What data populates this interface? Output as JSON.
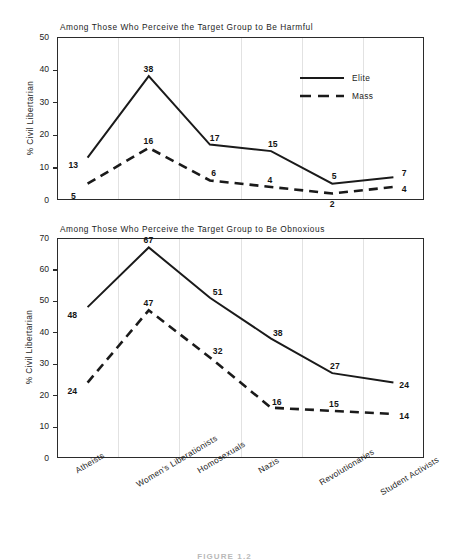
{
  "figure": {
    "caption": "FIGURE 1.2",
    "y_axis_label": "% Civil Libertarian",
    "legend": [
      {
        "name": "Elite",
        "style": "solid"
      },
      {
        "name": "Mass",
        "style": "dashed"
      }
    ],
    "categories": [
      "Atheists",
      "Women's Liberationists",
      "Homosexuals",
      "Nazis",
      "Revolutionaries",
      "Student Activists"
    ]
  },
  "chart_data": [
    {
      "type": "line",
      "title": "Among Those Who Perceive the Target Group to Be Harmful",
      "xlabel": "",
      "ylabel": "% Civil Libertarian",
      "ylim": [
        0,
        50
      ],
      "yticks": [
        0,
        10,
        20,
        30,
        40,
        50
      ],
      "grid": true,
      "legend_position": "top-right",
      "categories": [
        "Atheists",
        "Women's Liberationists",
        "Homosexuals",
        "Nazis",
        "Revolutionaries",
        "Student Activists"
      ],
      "series": [
        {
          "name": "Elite",
          "style": "solid",
          "values": [
            13,
            38,
            17,
            15,
            5,
            7
          ]
        },
        {
          "name": "Mass",
          "style": "dashed",
          "values": [
            5,
            16,
            6,
            4,
            2,
            4
          ]
        }
      ]
    },
    {
      "type": "line",
      "title": "Among Those Who Perceive the Target Group to Be Obnoxious",
      "xlabel": "",
      "ylabel": "% Civil Libertarian",
      "ylim": [
        0,
        70
      ],
      "yticks": [
        0,
        10,
        20,
        30,
        40,
        50,
        60,
        70
      ],
      "grid": true,
      "legend_position": "none",
      "categories": [
        "Atheists",
        "Women's Liberationists",
        "Homosexuals",
        "Nazis",
        "Revolutionaries",
        "Student Activists"
      ],
      "series": [
        {
          "name": "Elite",
          "style": "solid",
          "values": [
            48,
            67,
            51,
            38,
            27,
            24
          ]
        },
        {
          "name": "Mass",
          "style": "dashed",
          "values": [
            24,
            47,
            32,
            16,
            15,
            14
          ]
        }
      ]
    }
  ],
  "label_offsets": {
    "top": {
      "Elite": [
        {
          "dx": -14,
          "dy": 2
        },
        {
          "dx": 0,
          "dy": -12
        },
        {
          "dx": 5,
          "dy": -12
        },
        {
          "dx": 2,
          "dy": -12
        },
        {
          "dx": 2,
          "dy": -13
        },
        {
          "dx": 11,
          "dy": -9
        }
      ],
      "Mass": [
        {
          "dx": -14,
          "dy": 7
        },
        {
          "dx": 0,
          "dy": -12
        },
        {
          "dx": 4,
          "dy": -12
        },
        {
          "dx": -1,
          "dy": -12
        },
        {
          "dx": 0,
          "dy": 6
        },
        {
          "dx": 11,
          "dy": -3
        }
      ]
    },
    "bottom": {
      "Elite": [
        {
          "dx": -15,
          "dy": 3
        },
        {
          "dx": 0,
          "dy": -12
        },
        {
          "dx": 8,
          "dy": -11
        },
        {
          "dx": 7,
          "dy": -11
        },
        {
          "dx": 3,
          "dy": -12
        },
        {
          "dx": 11,
          "dy": -3
        }
      ],
      "Mass": [
        {
          "dx": -15,
          "dy": 3
        },
        {
          "dx": 0,
          "dy": -12
        },
        {
          "dx": 8,
          "dy": -11
        },
        {
          "dx": 6,
          "dy": -11
        },
        {
          "dx": 2,
          "dy": -12
        },
        {
          "dx": 11,
          "dy": -3
        }
      ]
    }
  }
}
